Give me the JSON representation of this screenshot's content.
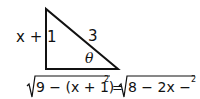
{
  "diagram": {
    "type": "right-triangle",
    "side_left_label": "x + 1",
    "hypotenuse_label": "3",
    "angle_label": "θ",
    "equation": {
      "lhs_radicand_a": "9 − (x + 1)",
      "lhs_exp": "2",
      "equals": "=",
      "rhs_radicand": "8 − 2x − x",
      "rhs_exp": "2"
    }
  }
}
